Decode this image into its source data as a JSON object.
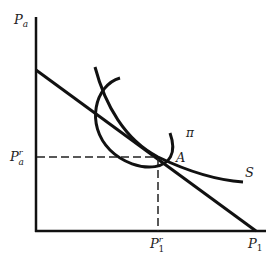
{
  "diagram": {
    "axes": {
      "y_label": "P",
      "y_label_sub": "a",
      "x_label": "P",
      "x_label_sub": "1"
    },
    "tick_labels": {
      "y_tick": "P",
      "y_tick_sup": "r",
      "y_tick_sub": "a",
      "x_tick": "P",
      "x_tick_sup": "r",
      "x_tick_sub": "1"
    },
    "curves": {
      "pi_label": "π",
      "s_label": "S"
    },
    "point_label": "A",
    "colors": {
      "line": "#111111",
      "background": "#ffffff"
    }
  }
}
